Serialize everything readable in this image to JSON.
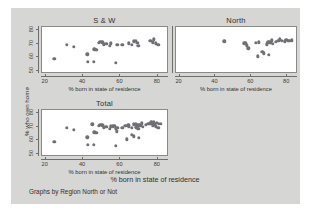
{
  "figure": {
    "background": "#d6d6d4",
    "panel_background": "#ffffff",
    "marker_color": "#6f6f74",
    "note": "Graphs by Region North or Not",
    "overall_xlabel": "% born in state of residence",
    "ylabel": "% who own home"
  },
  "chart_data": {
    "type": "scatter",
    "title": "",
    "xlabel": "% born in state of residence",
    "ylabel": "% who own home",
    "xlim": [
      18,
      86
    ],
    "ylim": [
      48,
      82
    ],
    "xticks": [
      20,
      40,
      60,
      80
    ],
    "yticks": [
      50,
      60,
      70,
      80
    ],
    "grid": false,
    "legend": "none",
    "note": "Graphs by Region North or Not",
    "panels": [
      {
        "title": "S & W",
        "points": [
          [
            24.5,
            58.8
          ],
          [
            31.2,
            68.9
          ],
          [
            35.0,
            67.6
          ],
          [
            42.3,
            62.2
          ],
          [
            42.6,
            56.8
          ],
          [
            45.8,
            56.9
          ],
          [
            46.0,
            66.0
          ],
          [
            46.8,
            65.4
          ],
          [
            47.3,
            65.6
          ],
          [
            48.5,
            70.4
          ],
          [
            49.3,
            71.5
          ],
          [
            50.2,
            71.0
          ],
          [
            51.0,
            69.5
          ],
          [
            52.5,
            69.8
          ],
          [
            54.2,
            68.5
          ],
          [
            55.0,
            70.2
          ],
          [
            57.5,
            55.9
          ],
          [
            58.4,
            68.9
          ],
          [
            61.0,
            69.3
          ],
          [
            64.5,
            70.3
          ],
          [
            66.0,
            69.0
          ],
          [
            67.3,
            71.6
          ],
          [
            68.2,
            71.8
          ],
          [
            69.0,
            70.5
          ],
          [
            69.5,
            68.3
          ],
          [
            76.0,
            72.2
          ],
          [
            77.2,
            71.0
          ],
          [
            77.8,
            73.0
          ],
          [
            79.0,
            70.3
          ],
          [
            80.2,
            69.2
          ]
        ]
      },
      {
        "title": "North",
        "points": [
          [
            45.0,
            71.6
          ],
          [
            56.0,
            70.2
          ],
          [
            56.8,
            70.6
          ],
          [
            57.5,
            68.8
          ],
          [
            58.2,
            66.5
          ],
          [
            62.5,
            70.4
          ],
          [
            63.5,
            60.9
          ],
          [
            64.3,
            70.8
          ],
          [
            66.0,
            64.2
          ],
          [
            67.0,
            63.0
          ],
          [
            68.5,
            69.5
          ],
          [
            69.0,
            70.7
          ],
          [
            69.4,
            71.3
          ],
          [
            69.8,
            62.0
          ],
          [
            70.2,
            70.9
          ],
          [
            70.8,
            70.4
          ],
          [
            71.3,
            72.4
          ],
          [
            72.0,
            70.0
          ],
          [
            73.5,
            71.4
          ],
          [
            75.0,
            71.8
          ],
          [
            76.0,
            73.2
          ],
          [
            77.0,
            72.0
          ],
          [
            78.5,
            71.6
          ],
          [
            79.5,
            72.8
          ],
          [
            80.5,
            72.2
          ],
          [
            81.5,
            71.8
          ],
          [
            82.5,
            72.5
          ]
        ]
      },
      {
        "title": "Total",
        "points": [
          [
            24.5,
            58.8
          ],
          [
            31.2,
            68.9
          ],
          [
            35.0,
            67.6
          ],
          [
            42.3,
            62.2
          ],
          [
            42.6,
            56.8
          ],
          [
            45.0,
            71.6
          ],
          [
            45.8,
            56.9
          ],
          [
            46.0,
            66.0
          ],
          [
            46.8,
            65.4
          ],
          [
            47.3,
            65.6
          ],
          [
            48.5,
            70.4
          ],
          [
            49.3,
            71.5
          ],
          [
            50.2,
            71.0
          ],
          [
            51.0,
            69.5
          ],
          [
            52.5,
            69.8
          ],
          [
            54.2,
            68.5
          ],
          [
            55.0,
            70.2
          ],
          [
            56.0,
            70.2
          ],
          [
            56.8,
            70.6
          ],
          [
            57.5,
            55.9
          ],
          [
            57.6,
            68.8
          ],
          [
            58.2,
            66.5
          ],
          [
            58.4,
            68.9
          ],
          [
            61.0,
            69.3
          ],
          [
            62.5,
            70.4
          ],
          [
            63.5,
            60.9
          ],
          [
            64.3,
            70.8
          ],
          [
            64.5,
            70.3
          ],
          [
            66.0,
            64.2
          ],
          [
            66.2,
            69.0
          ],
          [
            67.0,
            63.0
          ],
          [
            67.3,
            71.6
          ],
          [
            68.2,
            71.8
          ],
          [
            68.5,
            69.5
          ],
          [
            69.0,
            70.5
          ],
          [
            69.4,
            71.3
          ],
          [
            69.5,
            68.3
          ],
          [
            69.8,
            62.0
          ],
          [
            70.2,
            70.9
          ],
          [
            70.8,
            70.4
          ],
          [
            71.3,
            72.4
          ],
          [
            72.0,
            70.0
          ],
          [
            73.5,
            71.4
          ],
          [
            75.0,
            71.8
          ],
          [
            76.0,
            72.2
          ],
          [
            76.5,
            73.2
          ],
          [
            77.2,
            71.0
          ],
          [
            77.8,
            73.0
          ],
          [
            78.5,
            71.6
          ],
          [
            79.0,
            70.3
          ],
          [
            79.5,
            72.8
          ],
          [
            80.2,
            69.2
          ],
          [
            80.5,
            72.2
          ],
          [
            81.5,
            71.8
          ]
        ]
      }
    ]
  }
}
